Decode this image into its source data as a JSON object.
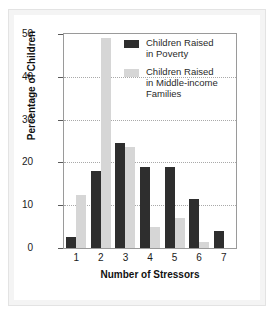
{
  "chart_data": {
    "type": "bar",
    "title": "",
    "xlabel": "Number of Stressors",
    "ylabel": "Percentage of Children",
    "categories": [
      "1",
      "2",
      "3",
      "4",
      "5",
      "6",
      "7"
    ],
    "ylim": [
      0,
      50
    ],
    "yticks": [
      "0",
      "10",
      "20",
      "30",
      "40",
      "50"
    ],
    "grid": true,
    "legend_position": "top-right",
    "series": [
      {
        "name": "Children Raised in Poverty",
        "name_line1": "Children Raised",
        "name_line2": "in Poverty",
        "color": "#2e2e2e",
        "values": [
          2.5,
          18,
          24.5,
          19,
          19,
          11.5,
          4
        ]
      },
      {
        "name": "Children Raised in Middle-income Families",
        "name_line1": "Children Raised",
        "name_line2": "in Middle-income",
        "name_line3": "Families",
        "color": "#d6d6d6",
        "values": [
          12.5,
          49,
          23.5,
          5,
          7,
          1.5,
          0
        ]
      }
    ]
  }
}
